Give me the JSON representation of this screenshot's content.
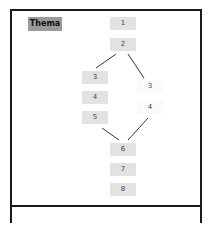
{
  "diagram": {
    "title": "Thema",
    "colors": {
      "box": "#e2e2e2",
      "faint_box": "#fafafa",
      "title_box": "#9a9a9a",
      "line": "#333333",
      "frame": "#1a1a1a"
    },
    "nodes": [
      {
        "id": "n1",
        "label": "1",
        "x": 110,
        "y": 17
      },
      {
        "id": "n2",
        "label": "2",
        "x": 110,
        "y": 38
      },
      {
        "id": "l3",
        "label": "3",
        "x": 82,
        "y": 71
      },
      {
        "id": "l4",
        "label": "4",
        "x": 82,
        "y": 91
      },
      {
        "id": "l5",
        "label": "5",
        "x": 82,
        "y": 111
      },
      {
        "id": "r3",
        "label": "3",
        "x": 137,
        "y": 80,
        "faint": true
      },
      {
        "id": "r4",
        "label": "4",
        "x": 137,
        "y": 101,
        "faint": true
      },
      {
        "id": "n6",
        "label": "6",
        "x": 110,
        "y": 143
      },
      {
        "id": "n7",
        "label": "7",
        "x": 110,
        "y": 163
      },
      {
        "id": "n8",
        "label": "8",
        "x": 110,
        "y": 183
      }
    ],
    "edges": [
      {
        "from": "n2",
        "to": "l3"
      },
      {
        "from": "n2",
        "to": "r3"
      },
      {
        "from": "l5",
        "to": "n6"
      },
      {
        "from": "r4",
        "to": "n6"
      }
    ]
  }
}
